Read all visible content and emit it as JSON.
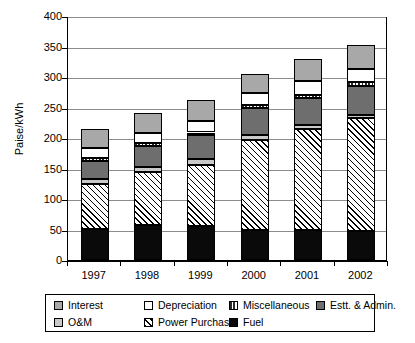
{
  "chart_data": {
    "type": "bar",
    "subtype": "stacked-vertical",
    "title": "",
    "xlabel": "",
    "ylabel": "Paise/kWh",
    "categories": [
      "1997",
      "1998",
      "1999",
      "2000",
      "2001",
      "2002"
    ],
    "ylim": [
      0,
      400
    ],
    "yticks": [
      0,
      50,
      100,
      150,
      200,
      250,
      300,
      350,
      400
    ],
    "ytick_labels": [
      "0",
      "50",
      "100",
      "150",
      "200",
      "250",
      "300",
      "350",
      "400"
    ],
    "grid": "horizontal",
    "legend_position": "bottom",
    "stack_order_bottom_to_top": [
      "Fuel",
      "Power Purchase",
      "O&M",
      "Estt. & Admin.",
      "Miscellaneous",
      "Depreciation",
      "Interest"
    ],
    "series": [
      {
        "name": "Fuel",
        "pattern": "solid-black",
        "color": "#0a0a0a",
        "values": [
          51,
          57,
          55,
          49,
          49,
          48
        ]
      },
      {
        "name": "Power Purchase",
        "pattern": "diagonal-hatch",
        "color": "#ffffff",
        "values": [
          73,
          87,
          101,
          147,
          165,
          185
        ]
      },
      {
        "name": "O&M",
        "pattern": "light-gray",
        "color": "#c9c9c9",
        "values": [
          8,
          8,
          9,
          9,
          7,
          4
        ]
      },
      {
        "name": "Estt. & Admin.",
        "pattern": "dark-gray",
        "color": "#6e6e6e",
        "values": [
          31,
          35,
          40,
          44,
          45,
          49
        ]
      },
      {
        "name": "Miscellaneous",
        "pattern": "vertical-bars",
        "color": "#ffffff",
        "values": [
          5,
          4,
          4,
          5,
          5,
          5
        ]
      },
      {
        "name": "Depreciation",
        "pattern": "white",
        "color": "#ffffff",
        "values": [
          16,
          17,
          19,
          19,
          23,
          22
        ]
      },
      {
        "name": "Interest",
        "pattern": "medium-gray",
        "color": "#a8a8a8",
        "values": [
          30,
          33,
          34,
          32,
          35,
          40
        ]
      }
    ],
    "cumulative_tops": {
      "1997": [
        51,
        124,
        132,
        163,
        168,
        184,
        214
      ],
      "1998": [
        57,
        144,
        152,
        187,
        191,
        208,
        241
      ],
      "1999": [
        55,
        156,
        165,
        205,
        209,
        228,
        262
      ],
      "2000": [
        49,
        196,
        205,
        249,
        254,
        273,
        305
      ],
      "2001": [
        49,
        214,
        221,
        266,
        271,
        294,
        329
      ],
      "2002": [
        48,
        233,
        237,
        286,
        291,
        313,
        353
      ]
    },
    "totals": [
      214,
      241,
      262,
      305,
      329,
      353
    ]
  },
  "legend": {
    "rows": [
      [
        {
          "label": "Interest",
          "swatch": "medium-gray-swatch"
        },
        {
          "label": "Depreciation",
          "swatch": "white-swatch"
        },
        {
          "label": "Miscellaneous",
          "swatch": "vertical-bars-swatch"
        },
        {
          "label": "Estt. & Admin.",
          "swatch": "dark-gray-swatch"
        }
      ],
      [
        {
          "label": "O&M",
          "swatch": "light-gray-swatch"
        },
        {
          "label": "Power Purchase",
          "swatch": "diagonal-hatch-swatch"
        },
        {
          "label": "Fuel",
          "swatch": "solid-black-swatch"
        }
      ]
    ]
  }
}
